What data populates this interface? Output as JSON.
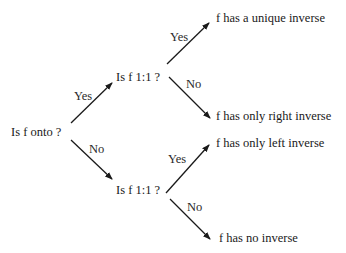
{
  "diagram": {
    "type": "decision-tree",
    "root": {
      "label": "Is f onto ?"
    },
    "questions": {
      "upper": {
        "label": "Is f 1:1 ?"
      },
      "lower": {
        "label": "Is f 1:1 ?"
      }
    },
    "outcomes": {
      "unique": "f has a unique inverse",
      "right": "f has only right inverse",
      "left": "f has only left inverse",
      "none": "f has no inverse"
    },
    "edges": {
      "root_yes": "Yes",
      "root_no": "No",
      "upper_yes": "Yes",
      "upper_no": "No",
      "lower_yes": "Yes",
      "lower_no": "No"
    },
    "colors": {
      "line": "#1a1a1a",
      "text": "#1a1a1a",
      "background": "#ffffff"
    }
  }
}
